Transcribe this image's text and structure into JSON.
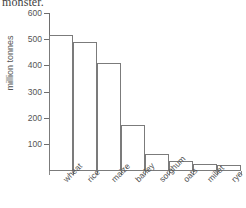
{
  "caption": {
    "clipped_text": "monster."
  },
  "chart_data": {
    "type": "bar",
    "title": "",
    "xlabel": "",
    "ylabel": "million tonnes",
    "categories": [
      "wheat",
      "rice",
      "maize",
      "barley",
      "sorghum",
      "oats",
      "millet",
      "rye"
    ],
    "values": [
      515,
      490,
      410,
      172,
      62,
      35,
      24,
      20
    ],
    "ylim": [
      0,
      600
    ],
    "yticks": [
      100,
      200,
      300,
      400,
      500,
      600
    ],
    "ytick_labels": [
      "100",
      "200",
      "300",
      "400",
      "500",
      "600"
    ],
    "grid": false,
    "legend": null,
    "bar_fill": "#ffffff",
    "bar_edge": "#7b7b7b",
    "axis_color": "#6e6e6e",
    "text_color": "#555555"
  }
}
